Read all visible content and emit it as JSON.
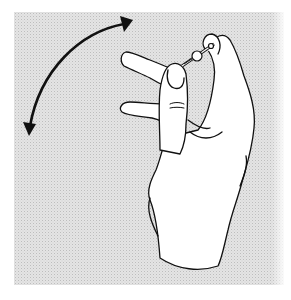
{
  "figure": {
    "description": "Line illustration of a hand holding a small rod-like object between thumb and fingers, with a curved double-headed arrow indicating back-and-forth rotation",
    "colors": {
      "background": "#ffffff",
      "stipple": "#e4e4e4",
      "ink": "#111111",
      "hand_fill": "#ffffff"
    },
    "elements": [
      {
        "name": "rotation-arrow",
        "type": "curved double-headed arrow"
      },
      {
        "name": "hand",
        "type": "line drawing"
      },
      {
        "name": "held-object",
        "type": "small rod with bead"
      }
    ]
  }
}
